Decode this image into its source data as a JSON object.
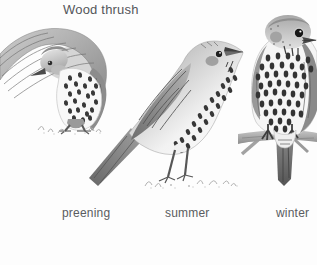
{
  "title": "Wood thrush",
  "figures": [
    {
      "id": "preening",
      "label": "preening"
    },
    {
      "id": "summer",
      "label": "summer"
    },
    {
      "id": "winter",
      "label": "winter"
    }
  ],
  "colors": {
    "background": "#fdfdfd",
    "text": "#54565a",
    "sketch_dark": "#383838",
    "sketch_mid": "#9a9a9a",
    "sketch_light": "#f5f5f5"
  }
}
